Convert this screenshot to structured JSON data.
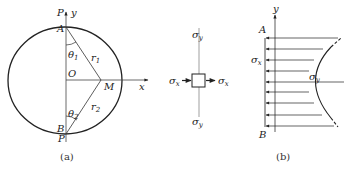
{
  "figure_a": {
    "caption": "(a)",
    "labels": {
      "P_top": "P",
      "y_axis": "y",
      "A": "A",
      "theta1": "θ",
      "theta1_sub": "1",
      "r1": "r",
      "r1_sub": "1",
      "O": "O",
      "M": "M",
      "x_axis": "x",
      "theta2": "θ",
      "theta2_sub": "2",
      "r2": "r",
      "r2_sub": "2",
      "B": "B",
      "P_bottom": "P"
    }
  },
  "stress_element": {
    "sigma_y_top": "σ",
    "sigma_y_top_sub": "y",
    "sigma_x_left": "σ",
    "sigma_x_left_sub": "x",
    "sigma_x_right": "σ",
    "sigma_x_right_sub": "x",
    "sigma_y_bottom": "σ",
    "sigma_y_bottom_sub": "y"
  },
  "figure_b": {
    "caption": "(b)",
    "labels": {
      "y_axis": "y",
      "A": "A",
      "sigma_x": "σ",
      "sigma_x_sub": "x",
      "sigma_y": "σ",
      "sigma_y_sub": "y",
      "B": "B"
    }
  },
  "colors": {
    "stroke": "#222222",
    "thin": "#555555"
  }
}
